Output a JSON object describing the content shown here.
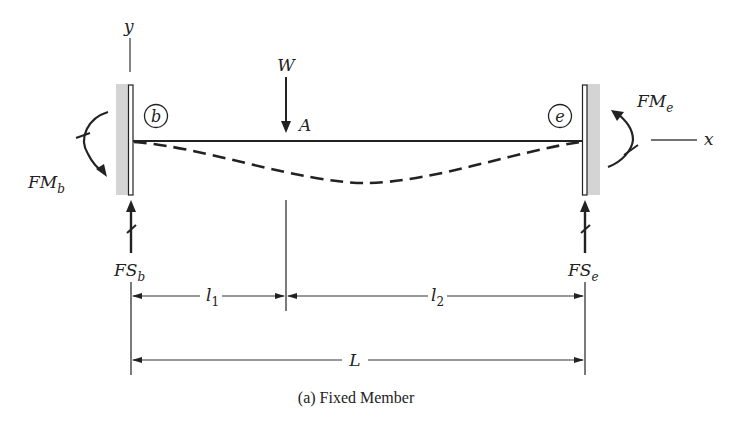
{
  "figure": {
    "caption": "(a) Fixed Member",
    "axes": {
      "y_label": "y",
      "x_label": "x"
    },
    "load": {
      "symbol": "W",
      "point_label": "A"
    },
    "supports": {
      "left": {
        "node_label": "b",
        "moment_label": "FM",
        "moment_sub": "b",
        "shear_label": "FS",
        "shear_sub": "b"
      },
      "right": {
        "node_label": "e",
        "moment_label": "FM",
        "moment_sub": "e",
        "shear_label": "FS",
        "shear_sub": "e"
      }
    },
    "dimensions": {
      "l1": {
        "label": "l",
        "sub": "1"
      },
      "l2": {
        "label": "l",
        "sub": "2"
      },
      "L": {
        "label": "L"
      }
    },
    "colors": {
      "ink": "#222222",
      "wall_fill": "#d4d4d4"
    }
  }
}
